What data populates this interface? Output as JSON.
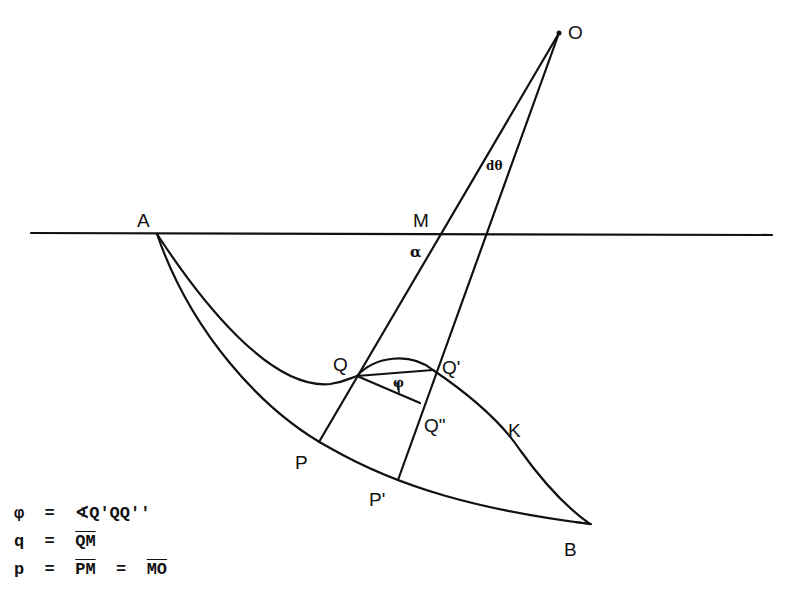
{
  "diagram": {
    "points": {
      "O": {
        "label": "O"
      },
      "A": {
        "label": "A"
      },
      "M": {
        "label": "M"
      },
      "Q": {
        "label": "Q"
      },
      "Q1": {
        "label": "Q'"
      },
      "Q2": {
        "label": "Q\""
      },
      "P": {
        "label": "P"
      },
      "P1": {
        "label": "P'"
      },
      "K": {
        "label": "K"
      },
      "B": {
        "label": "B"
      }
    },
    "angles": {
      "alpha": "α",
      "dtheta": "dθ",
      "phi": "φ"
    }
  },
  "legend": {
    "row1": {
      "lhs": "φ",
      "eq": "=",
      "rhs": "∢Q'QQ''"
    },
    "row2": {
      "lhs": "q",
      "eq": "=",
      "rhs": "QM"
    },
    "row3": {
      "lhs": "p",
      "eq": "=",
      "rhs1": "PM",
      "eq2": "=",
      "rhs2": "MO"
    }
  }
}
